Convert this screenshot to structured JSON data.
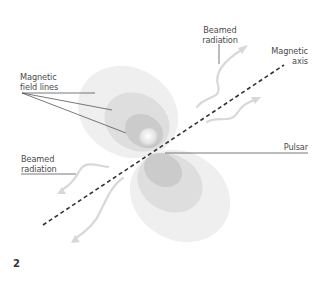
{
  "figure": {
    "number": "2",
    "labels": {
      "beamed_radiation_top": [
        "Beamed",
        "radiation"
      ],
      "magnetic_axis": [
        "Magnetic",
        "axis"
      ],
      "magnetic_field_lines": [
        "Magnetic",
        "field lines"
      ],
      "pulsar": "Pulsar",
      "beamed_radiation_bottom": [
        "Beamed",
        "radiation"
      ]
    },
    "colors": {
      "outer_lobe": "#ededed",
      "middle_lobe": "#dcdcdc",
      "inner_lobe": "#c8c8c8",
      "pulsar_core": "#f4f4f4",
      "axis_line": "#333333",
      "leader_line": "#555555",
      "radiation_arrow": "#d8d8d8"
    }
  }
}
